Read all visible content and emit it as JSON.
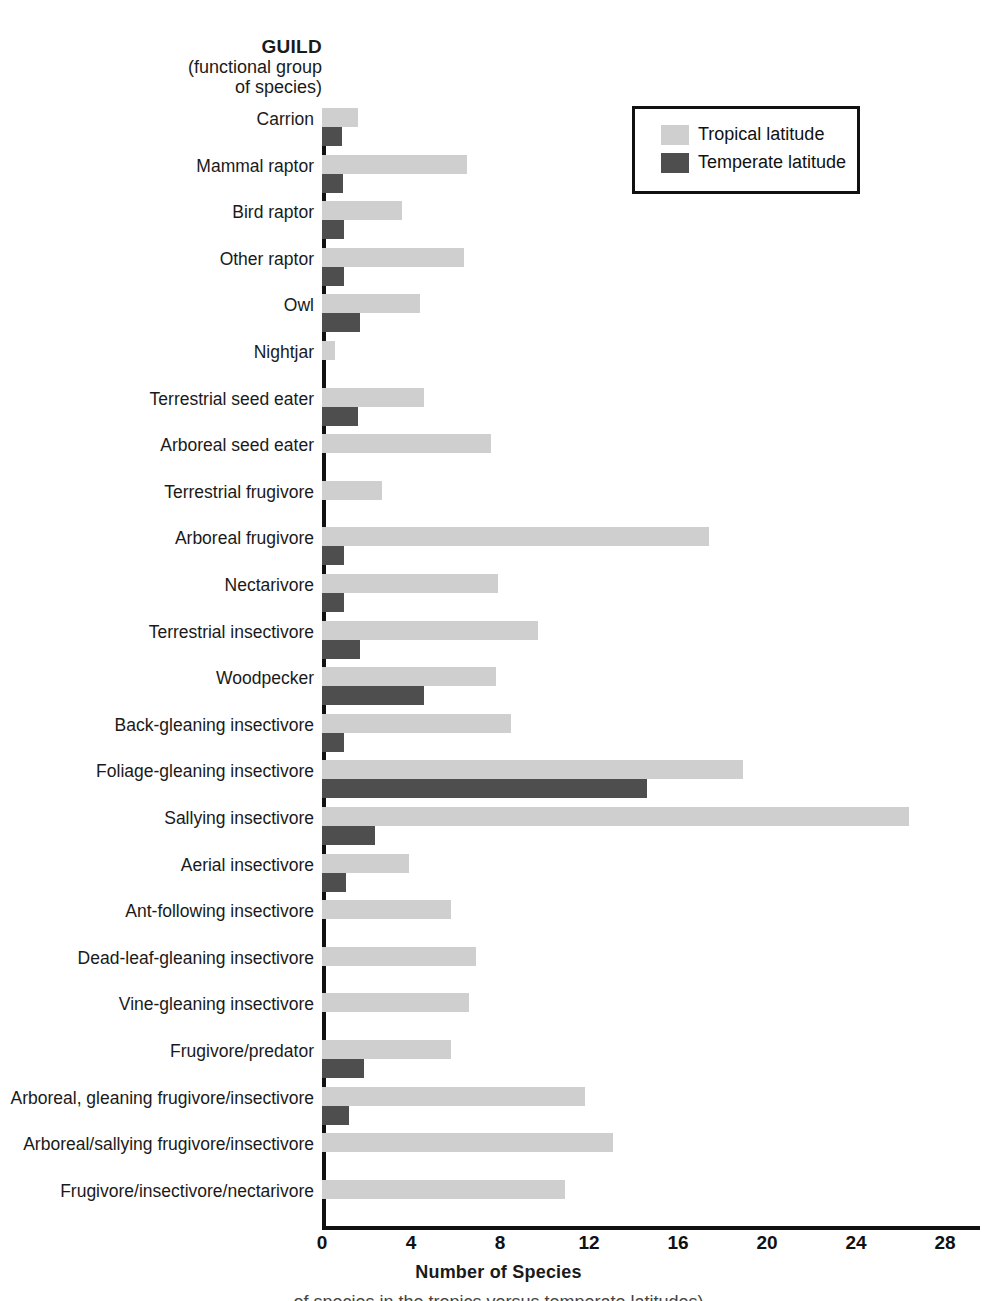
{
  "axis_heading": {
    "title": "GUILD",
    "sub_line_1": "(functional group",
    "sub_line_2": "of species)"
  },
  "legend": {
    "items": [
      {
        "label": "Tropical latitude",
        "color": "#cfcfcf"
      },
      {
        "label": "Temperate latitude",
        "color": "#4e4e4e"
      }
    ]
  },
  "x_axis": {
    "title": "Number of Species",
    "ticks": [
      "0",
      "4",
      "8",
      "12",
      "16",
      "20",
      "24",
      "28"
    ]
  },
  "bottom_caption": "of species in the tropics versus temperate latitudes)",
  "chart_data": {
    "type": "bar",
    "orientation": "horizontal",
    "title": "",
    "xlabel": "Number of Species",
    "ylabel": "GUILD (functional group of species)",
    "xlim": [
      0,
      28
    ],
    "xticks": [
      0,
      4,
      8,
      12,
      16,
      20,
      24,
      28
    ],
    "grid": false,
    "legend_position": "top-right",
    "categories": [
      "Carrion",
      "Mammal raptor",
      "Bird raptor",
      "Other raptor",
      "Owl",
      "Nightjar",
      "Terrestrial seed eater",
      "Arboreal seed eater",
      "Terrestrial frugivore",
      "Arboreal frugivore",
      "Nectarivore",
      "Terrestrial insectivore",
      "Woodpecker",
      "Back-gleaning insectivore",
      "Foliage-gleaning insectivore",
      "Sallying insectivore",
      "Aerial insectivore",
      "Ant-following insectivore",
      "Dead-leaf-gleaning insectivore",
      "Vine-gleaning insectivore",
      "Frugivore/predator",
      "Arboreal, gleaning frugivore/insectivore",
      "Arboreal/sallying frugivore/insectivore",
      "Frugivore/insectivore/nectarivore"
    ],
    "series": [
      {
        "name": "Tropical latitude",
        "color": "#cfcfcf",
        "values": [
          1.6,
          6.5,
          3.6,
          6.4,
          4.4,
          0.6,
          4.6,
          7.6,
          2.7,
          17.4,
          7.9,
          9.7,
          7.8,
          8.5,
          18.9,
          26.4,
          3.9,
          5.8,
          6.9,
          6.6,
          5.8,
          11.8,
          13.1,
          10.9
        ]
      },
      {
        "name": "Temperate latitude",
        "color": "#4e4e4e",
        "values": [
          0.9,
          0.95,
          1.0,
          1.0,
          1.7,
          0,
          1.6,
          0,
          0,
          1.0,
          1.0,
          1.7,
          4.6,
          1.0,
          14.6,
          2.4,
          1.1,
          0,
          0,
          0,
          1.9,
          1.2,
          0,
          0
        ]
      }
    ]
  }
}
